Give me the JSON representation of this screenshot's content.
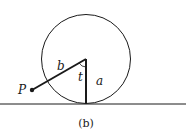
{
  "figure": {
    "caption": "(b)",
    "labels": {
      "point": "P",
      "segment_b": "b",
      "angle": "t",
      "radius": "a"
    },
    "colors": {
      "stroke": "#1a1a1a",
      "background": "#ffffff"
    }
  }
}
